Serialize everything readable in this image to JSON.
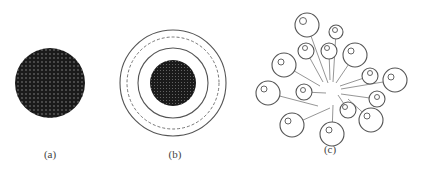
{
  "figure": {
    "panels": [
      {
        "id": "a",
        "label": "(a)",
        "label_pos": [
          50,
          158
        ],
        "description": "dense dark disc with dot lattice",
        "disc": {
          "cx": 50,
          "cy": 83,
          "r": 35,
          "fill": "#1a1a1a",
          "dot_color": "#9a9a9a",
          "dot_spacing": 4
        }
      },
      {
        "id": "b",
        "label": "(b)",
        "label_pos": [
          175,
          158
        ],
        "description": "dark core surrounded by concentric shells",
        "center": [
          173,
          83
        ],
        "rings": [
          {
            "r": 53,
            "style": "solid"
          },
          {
            "r": 46,
            "style": "dashed"
          },
          {
            "r": 35,
            "style": "solid"
          }
        ],
        "core": {
          "r": 23,
          "fill": "#1a1a1a",
          "dot_color": "#7a7a7a",
          "dot_spacing": 3
        }
      },
      {
        "id": "c",
        "label": "(c)",
        "label_pos": [
          330,
          153
        ],
        "description": "dispersed spheres tethered to a common center",
        "hub": [
          333,
          88
        ],
        "spheres": [
          {
            "cx": 307,
            "cy": 25,
            "r": 12,
            "ir": 3.5,
            "iox": -4,
            "ioy": -4,
            "ax": 328,
            "ay": 83
          },
          {
            "cx": 336,
            "cy": 32,
            "r": 7,
            "ir": 2.5,
            "iox": -1,
            "ioy": -2,
            "ax": 333,
            "ay": 82
          },
          {
            "cx": 306,
            "cy": 51,
            "r": 8,
            "ir": 2.5,
            "iox": -1,
            "ioy": -3,
            "ax": 323,
            "ay": 82
          },
          {
            "cx": 329,
            "cy": 51,
            "r": 8,
            "ir": 2.5,
            "iox": -2,
            "ioy": -3,
            "ax": 330,
            "ay": 80
          },
          {
            "cx": 355,
            "cy": 55,
            "r": 12,
            "ir": 3,
            "iox": -4,
            "ioy": -4,
            "ax": 336,
            "ay": 83
          },
          {
            "cx": 284,
            "cy": 65,
            "r": 12,
            "ir": 3,
            "iox": -3,
            "ioy": -3,
            "ax": 320,
            "ay": 86
          },
          {
            "cx": 370,
            "cy": 76,
            "r": 8,
            "ir": 2.5,
            "iox": 0,
            "ioy": -3,
            "ax": 340,
            "ay": 86
          },
          {
            "cx": 395,
            "cy": 80,
            "r": 12,
            "ir": 3,
            "iox": -4,
            "ioy": -3,
            "ax": 341,
            "ay": 89
          },
          {
            "cx": 268,
            "cy": 93,
            "r": 12,
            "ir": 3,
            "iox": -4,
            "ioy": -4,
            "ax": 318,
            "ay": 106
          },
          {
            "cx": 304,
            "cy": 92,
            "r": 8,
            "ir": 2.5,
            "iox": -1,
            "ioy": -2,
            "ax": 326,
            "ay": 93
          },
          {
            "cx": 377,
            "cy": 99,
            "r": 8,
            "ir": 2.5,
            "iox": 0,
            "ioy": -2,
            "ax": 341,
            "ay": 94
          },
          {
            "cx": 348,
            "cy": 110,
            "r": 8,
            "ir": 2.5,
            "iox": -3,
            "ioy": -3,
            "ax": 338,
            "ay": 95
          },
          {
            "cx": 371,
            "cy": 120,
            "r": 12,
            "ir": 3,
            "iox": -4,
            "ioy": -4,
            "ax": 348,
            "ay": 99
          },
          {
            "cx": 292,
            "cy": 125,
            "r": 12,
            "ir": 3,
            "iox": -4,
            "ioy": -4,
            "ax": 330,
            "ay": 108
          },
          {
            "cx": 332,
            "cy": 134,
            "r": 12,
            "ir": 3,
            "iox": -3,
            "ioy": -4,
            "ax": 333,
            "ay": 105
          }
        ]
      }
    ],
    "colors": {
      "stroke": "#555555",
      "line": "#8a8a8a",
      "dark": "#1a1a1a"
    }
  }
}
